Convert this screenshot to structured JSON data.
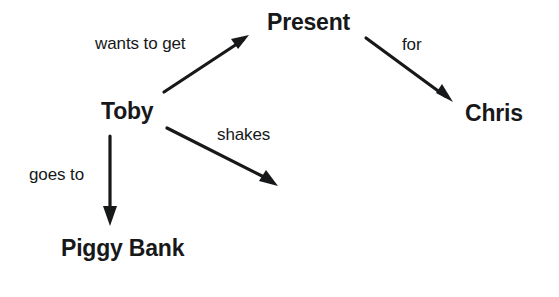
{
  "diagram": {
    "type": "concept-map",
    "background_color": "#ffffff",
    "stroke_color": "#17181a",
    "text_color": "#17181a",
    "width": 559,
    "height": 297,
    "nodes": [
      {
        "id": "toby",
        "label": "Toby"
      },
      {
        "id": "present",
        "label": "Present"
      },
      {
        "id": "chris",
        "label": "Chris"
      },
      {
        "id": "piggy",
        "label": "Piggy Bank"
      }
    ],
    "edges": [
      {
        "id": "toby-present",
        "label": "wants to get",
        "from": "toby",
        "to": "present"
      },
      {
        "id": "present-chris",
        "label": "for",
        "from": "present",
        "to": "chris"
      },
      {
        "id": "toby-shakes",
        "label": "shakes",
        "from": "toby",
        "to": "present"
      },
      {
        "id": "toby-piggy",
        "label": "goes to",
        "from": "toby",
        "to": "piggy"
      }
    ]
  }
}
